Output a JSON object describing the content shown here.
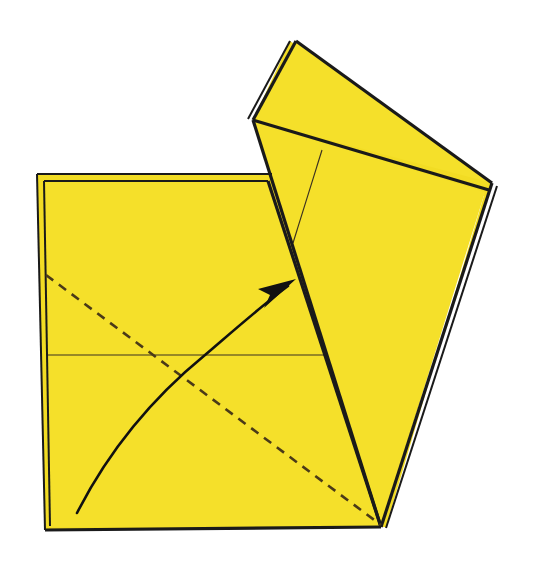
{
  "figure": {
    "kind": "origami-fold-diagram",
    "canvas": {
      "width": 536,
      "height": 567
    },
    "background_color": "#FFFFFF"
  },
  "colors": {
    "paper": "#F5E02A",
    "paper_shade": "#F2DC24",
    "outline": "#1A1A1A",
    "crease_thin": "#3A3020",
    "dashed_crease": "#4A3A18",
    "arrow": "#111111",
    "gap": "#FFFFFF"
  },
  "strokes": {
    "outline_width": 3.2,
    "layer_edge_width": 2.0,
    "thin_crease_width": 1.1,
    "dashed_width": 2.6,
    "dash_pattern": "9 7",
    "arrow_curve_width": 2.6
  },
  "shapes": {
    "base_square_back": {
      "name": "base-square-back-layer",
      "points": "37,174 270,174 281,180 385,527 45,530"
    },
    "base_square_front": {
      "name": "base-square-front-layer",
      "points": "44,181 268,181 381,527 49,527"
    },
    "flap_back_layer": {
      "name": "flap-back-layer",
      "points": "290,41 492,183 484,196 253,120"
    },
    "flap_upper_triangle": {
      "name": "flap-upper-triangle",
      "points": "296,41 492,183 253,120"
    },
    "flap_lower_panel": {
      "name": "flap-lower-panel",
      "points": "253,120 485,192 381,527"
    },
    "flap_right_back_edge": {
      "name": "flap-right-back-edge",
      "points": "492,183 485,192 386,527 381,527"
    }
  },
  "lines": {
    "square_top_outer": {
      "name": "square-top-outer-edge",
      "x1": 37,
      "y1": 174,
      "x2": 272,
      "y2": 174
    },
    "square_top_inner": {
      "name": "square-top-inner-edge",
      "x1": 44,
      "y1": 181,
      "x2": 268,
      "y2": 181
    },
    "square_left_outer": {
      "name": "square-left-outer-edge",
      "x1": 37,
      "y1": 174,
      "x2": 45,
      "y2": 530
    },
    "square_left_inner": {
      "name": "square-left-inner-edge",
      "x1": 44,
      "y1": 181,
      "x2": 50,
      "y2": 526
    },
    "square_bottom": {
      "name": "square-bottom-edge",
      "x1": 45,
      "y1": 530,
      "x2": 381,
      "y2": 527
    },
    "fold_diagonal_main": {
      "name": "flap-fold-diagonal",
      "x1": 268,
      "y1": 181,
      "x2": 381,
      "y2": 527
    },
    "flap_left_edge": {
      "name": "flap-left-edge",
      "x1": 296,
      "y1": 41,
      "x2": 253,
      "y2": 120
    },
    "flap_left_edge_back": {
      "name": "flap-left-edge-back-layer",
      "x1": 290,
      "y1": 41,
      "x2": 248,
      "y2": 119
    },
    "flap_top_edge": {
      "name": "flap-top-edge",
      "x1": 296,
      "y1": 41,
      "x2": 492,
      "y2": 183
    },
    "flap_inner_fold": {
      "name": "flap-inner-fold-edge",
      "x1": 253,
      "y1": 120,
      "x2": 489,
      "y2": 190
    },
    "flap_lower_left_edge": {
      "name": "flap-lower-left-edge",
      "x1": 253,
      "y1": 120,
      "x2": 381,
      "y2": 527
    },
    "flap_right_edge": {
      "name": "flap-right-edge",
      "x1": 492,
      "y1": 183,
      "x2": 381,
      "y2": 527
    },
    "flap_right_edge_back": {
      "name": "flap-right-edge-back-layer",
      "x1": 497,
      "y1": 186,
      "x2": 386,
      "y2": 528
    },
    "horizontal_crease": {
      "name": "horizontal-half-crease",
      "x1": 47,
      "y1": 355,
      "x2": 325,
      "y2": 355
    },
    "flap_thin_crease": {
      "name": "flap-thin-crease",
      "x1": 322,
      "y1": 150,
      "x2": 293,
      "y2": 243
    }
  },
  "dashed_crease": {
    "name": "valley-fold-dashed-line",
    "label": "valley fold",
    "x1": 46,
    "y1": 275,
    "x2": 381,
    "y2": 525
  },
  "fold_arrow": {
    "name": "fold-direction-arrow",
    "label": "fold flap up and to the right",
    "curve_path": "M 77,513 C 108,452 150,400 205,355 C 240,325 265,303 288,286",
    "head": {
      "tip_x": 296,
      "tip_y": 279,
      "points": "296,279 258,289 270,295 264,308"
    }
  }
}
